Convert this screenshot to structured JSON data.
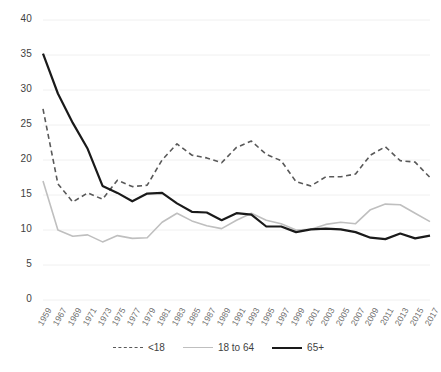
{
  "chart_data": {
    "type": "line",
    "title": "",
    "xlabel": "",
    "ylabel": "",
    "ylim": [
      0,
      40
    ],
    "ytick_values": [
      40,
      35,
      30,
      25,
      20,
      15,
      10,
      5,
      0
    ],
    "ytick_labels": [
      "40",
      "35",
      "30",
      "25",
      "20",
      "15",
      "10",
      "5",
      "0"
    ],
    "grid": true,
    "legend_position": "bottom",
    "x": [
      1959,
      1967,
      1969,
      1971,
      1973,
      1975,
      1977,
      1979,
      1981,
      1983,
      1985,
      1987,
      1989,
      1991,
      1993,
      1995,
      1997,
      1999,
      2001,
      2003,
      2005,
      2007,
      2009,
      2011,
      2013,
      2015,
      2017
    ],
    "xtick_labels": [
      "1959",
      "1967",
      "1969",
      "1971",
      "1973",
      "1975",
      "1977",
      "1979",
      "1981",
      "1983",
      "1985",
      "1987",
      "1989",
      "1991",
      "1993",
      "1995",
      "1997",
      "1999",
      "2001",
      "2003",
      "2005",
      "2007",
      "2009",
      "2011",
      "2013",
      "2015",
      "2017"
    ],
    "series": [
      {
        "name": "<18",
        "color": "#595959",
        "style": "dashed",
        "width": 1.6,
        "values": [
          27.3,
          16.6,
          14.0,
          15.3,
          14.4,
          17.1,
          16.2,
          16.4,
          20.0,
          22.3,
          20.7,
          20.3,
          19.6,
          21.8,
          22.7,
          20.8,
          19.9,
          16.9,
          16.3,
          17.6,
          17.6,
          18.0,
          20.7,
          21.9,
          19.9,
          19.7,
          17.5
        ]
      },
      {
        "name": "18 to 64",
        "color": "#bfbfbf",
        "style": "solid",
        "width": 1.6,
        "values": [
          17.0,
          10.0,
          9.1,
          9.3,
          8.3,
          9.2,
          8.8,
          8.9,
          11.1,
          12.4,
          11.3,
          10.6,
          10.2,
          11.4,
          12.4,
          11.4,
          10.9,
          10.0,
          10.1,
          10.8,
          11.1,
          10.9,
          12.9,
          13.7,
          13.6,
          12.4,
          11.2
        ]
      },
      {
        "name": "65+",
        "color": "#1a1a1a",
        "style": "solid",
        "width": 2.2,
        "values": [
          35.2,
          29.5,
          25.3,
          21.6,
          16.3,
          15.3,
          14.1,
          15.2,
          15.3,
          13.8,
          12.6,
          12.5,
          11.4,
          12.4,
          12.2,
          10.5,
          10.5,
          9.7,
          10.1,
          10.2,
          10.1,
          9.7,
          8.9,
          8.7,
          9.5,
          8.8,
          9.2
        ]
      }
    ]
  },
  "legend": {
    "items": [
      {
        "label": "<18"
      },
      {
        "label": "18 to 64"
      },
      {
        "label": "65+"
      }
    ]
  }
}
